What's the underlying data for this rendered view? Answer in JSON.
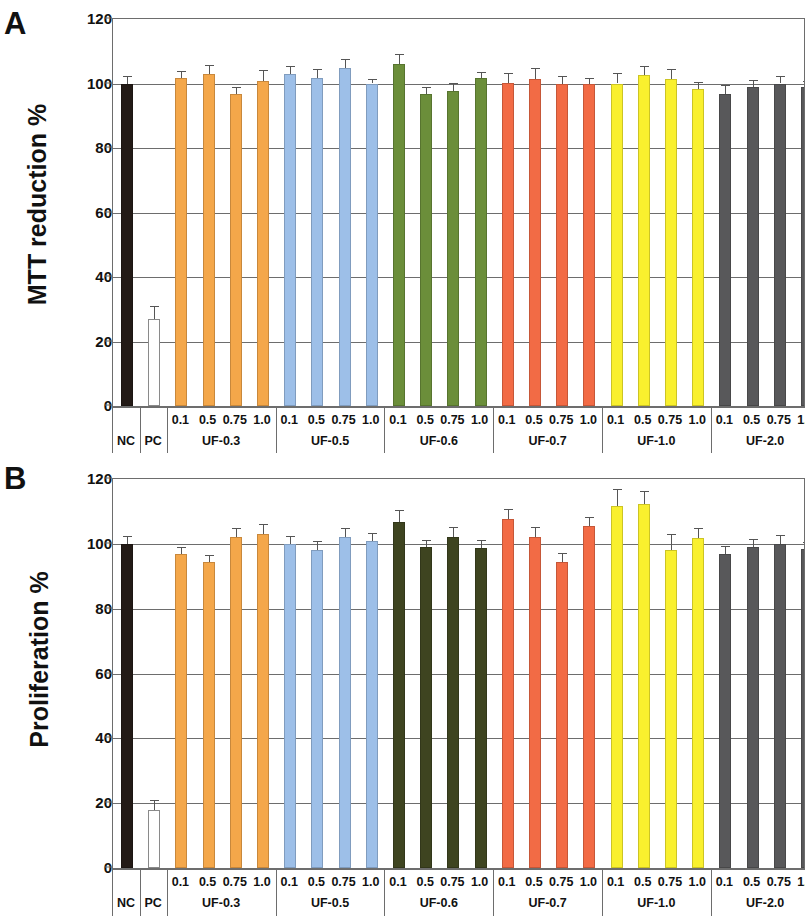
{
  "figure": {
    "panels": [
      {
        "letter": "A",
        "axis_title": "MTT reduction %"
      },
      {
        "letter": "B",
        "axis_title": "Proliferation %"
      }
    ]
  },
  "chart_data": [
    {
      "type": "bar",
      "title": "MTT reduction %",
      "panel": "A",
      "xlabel": "",
      "ylabel": "MTT reduction %",
      "ylim": [
        0,
        120
      ],
      "yticks": [
        0,
        20,
        40,
        60,
        80,
        100,
        120
      ],
      "grid": true,
      "legend": "none",
      "group_labels": [
        "NC",
        "PC",
        "UF-0.3",
        "UF-0.5",
        "UF-0.6",
        "UF-0.7",
        "UF-1.0",
        "UF-2.0"
      ],
      "concentration_labels": [
        "0.1",
        "0.5",
        "0.75",
        "1.0"
      ],
      "groups": [
        {
          "name": "NC",
          "color": "#231a16",
          "categories": [
            "NC"
          ],
          "values": [
            99.8
          ],
          "errors": [
            2.5
          ]
        },
        {
          "name": "PC",
          "color": "#ffffff",
          "categories": [
            "PC"
          ],
          "values": [
            27.0
          ],
          "errors": [
            4.0
          ]
        },
        {
          "name": "UF-0.3",
          "color": "#f4a74a",
          "categories": [
            "0.1",
            "0.5",
            "0.75",
            "1.0"
          ],
          "values": [
            101.8,
            103.0,
            96.8,
            100.8
          ],
          "errors": [
            2.0,
            2.8,
            2.2,
            3.5
          ]
        },
        {
          "name": "UF-0.5",
          "color": "#9dbfe8",
          "categories": [
            "0.1",
            "0.5",
            "0.75",
            "1.0"
          ],
          "values": [
            103.0,
            101.8,
            104.8,
            100.0
          ],
          "errors": [
            2.4,
            2.6,
            2.7,
            1.5
          ]
        },
        {
          "name": "UF-0.6",
          "color": "#6b8e3a",
          "categories": [
            "0.1",
            "0.5",
            "0.75",
            "1.0"
          ],
          "values": [
            106.0,
            96.8,
            97.8,
            101.7
          ],
          "errors": [
            3.2,
            2.2,
            2.3,
            2.0
          ]
        },
        {
          "name": "UF-0.7",
          "color": "#f26b45",
          "categories": [
            "0.1",
            "0.5",
            "0.75",
            "1.0"
          ],
          "values": [
            100.2,
            101.5,
            99.8,
            99.8
          ],
          "errors": [
            3.0,
            3.2,
            2.5,
            1.8
          ]
        },
        {
          "name": "UF-1.0",
          "color": "#f9f02e",
          "categories": [
            "0.1",
            "0.5",
            "0.75",
            "1.0"
          ],
          "values": [
            100.0,
            102.5,
            101.3,
            98.3
          ],
          "errors": [
            3.4,
            3.0,
            3.3,
            2.2
          ]
        },
        {
          "name": "UF-2.0",
          "color": "#58585a",
          "categories": [
            "0.1",
            "0.5",
            "0.75",
            "1.0"
          ],
          "values": [
            96.8,
            99.0,
            100.0,
            98.8
          ],
          "errors": [
            2.6,
            2.0,
            2.2,
            2.0
          ]
        }
      ]
    },
    {
      "type": "bar",
      "title": "Proliferation %",
      "panel": "B",
      "xlabel": "",
      "ylabel": "Proliferation %",
      "ylim": [
        0,
        120
      ],
      "yticks": [
        0,
        20,
        40,
        60,
        80,
        100,
        120
      ],
      "grid": true,
      "legend": "none",
      "group_labels": [
        "NC",
        "PC",
        "UF-0.3",
        "UF-0.5",
        "UF-0.6",
        "UF-0.7",
        "UF-1.0",
        "UF-2.0"
      ],
      "concentration_labels": [
        "0.1",
        "0.5",
        "0.75",
        "1.0"
      ],
      "groups": [
        {
          "name": "NC",
          "color": "#231a16",
          "categories": [
            "NC"
          ],
          "values": [
            100.0
          ],
          "errors": [
            2.5
          ]
        },
        {
          "name": "PC",
          "color": "#ffffff",
          "categories": [
            "PC"
          ],
          "values": [
            18.0
          ],
          "errors": [
            3.0
          ]
        },
        {
          "name": "UF-0.3",
          "color": "#f4a74a",
          "categories": [
            "0.1",
            "0.5",
            "0.75",
            "1.0"
          ],
          "values": [
            97.0,
            94.5,
            102.0,
            103.0
          ],
          "errors": [
            2.0,
            2.2,
            3.0,
            3.2
          ]
        },
        {
          "name": "UF-0.5",
          "color": "#9dbfe8",
          "categories": [
            "0.1",
            "0.5",
            "0.75",
            "1.0"
          ],
          "values": [
            99.8,
            98.2,
            102.0,
            100.8
          ],
          "errors": [
            2.5,
            2.6,
            3.0,
            2.4
          ]
        },
        {
          "name": "UF-0.6",
          "color": "#3e4420",
          "categories": [
            "0.1",
            "0.5",
            "0.75",
            "1.0"
          ],
          "values": [
            106.7,
            99.0,
            102.0,
            98.8
          ],
          "errors": [
            3.6,
            2.2,
            3.2,
            2.4
          ]
        },
        {
          "name": "UF-0.7",
          "color": "#f26b45",
          "categories": [
            "0.1",
            "0.5",
            "0.75",
            "1.0"
          ],
          "values": [
            107.7,
            102.0,
            94.5,
            105.5
          ],
          "errors": [
            3.0,
            3.2,
            2.6,
            2.8
          ]
        },
        {
          "name": "UF-1.0",
          "color": "#f9f02e",
          "categories": [
            "0.1",
            "0.5",
            "0.75",
            "1.0"
          ],
          "values": [
            111.8,
            112.3,
            98.0,
            101.8
          ],
          "errors": [
            5.0,
            4.0,
            5.0,
            3.0
          ]
        },
        {
          "name": "UF-2.0",
          "color": "#58585a",
          "categories": [
            "0.1",
            "0.5",
            "0.75",
            "1.0"
          ],
          "values": [
            96.8,
            99.0,
            100.0,
            98.3
          ],
          "errors": [
            2.6,
            2.4,
            2.6,
            2.2
          ]
        }
      ]
    }
  ]
}
